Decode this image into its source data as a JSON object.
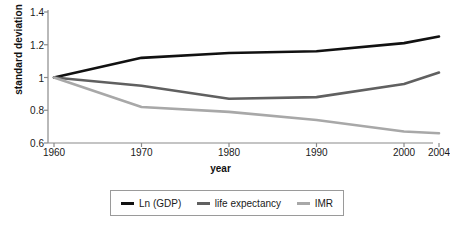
{
  "chart_data": {
    "type": "line",
    "title": "",
    "xlabel": "year",
    "ylabel": "standard deviation",
    "x": [
      1960,
      1970,
      1980,
      1990,
      2000,
      2004
    ],
    "xticklabels": [
      "1960",
      "1970",
      "1980",
      "1990",
      "2000",
      "2004"
    ],
    "yticklabels": [
      "1.4",
      "1.2",
      "1",
      "0.8",
      "0.6"
    ],
    "yticks": [
      1.4,
      1.2,
      1.0,
      0.8,
      0.6
    ],
    "xlim": [
      1960,
      2004
    ],
    "ylim": [
      0.6,
      1.4
    ],
    "grid": false,
    "legend_position": "bottom",
    "series": [
      {
        "name": "Ln (GDP)",
        "color": "#111111",
        "values": [
          1.0,
          1.12,
          1.15,
          1.16,
          1.21,
          1.25
        ]
      },
      {
        "name": "life expectancy",
        "color": "#606060",
        "values": [
          1.0,
          0.95,
          0.87,
          0.88,
          0.96,
          1.03
        ]
      },
      {
        "name": "IMR",
        "color": "#a8a8a8",
        "values": [
          1.0,
          0.82,
          0.79,
          0.74,
          0.67,
          0.66
        ]
      }
    ]
  },
  "axes": {
    "axis_color": "#8a8a8a",
    "tick_color": "#1a1a1a"
  },
  "legend": {
    "border_color": "#9a9a9a",
    "items": [
      {
        "label": "Ln (GDP)",
        "color": "#111111"
      },
      {
        "label": "life expectancy",
        "color": "#606060"
      },
      {
        "label": "IMR",
        "color": "#a8a8a8"
      }
    ]
  }
}
